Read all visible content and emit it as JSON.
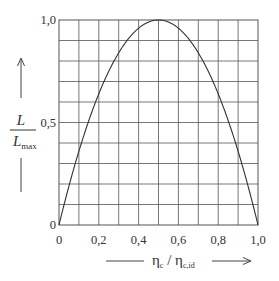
{
  "chart_data": {
    "type": "line",
    "title": "",
    "xlabel": "ηc / ηc,id",
    "xlabel_parts": {
      "main": "η",
      "sub": "c",
      "sep": " / ",
      "main2": "η",
      "sub2": "c,id"
    },
    "ylabel": "L / Lmax",
    "ylabel_parts": {
      "num": "L",
      "den": "L",
      "den_sub": "max"
    },
    "xlim": [
      0,
      1.0
    ],
    "ylim": [
      0,
      1.0
    ],
    "x_ticks": [
      "0",
      "0,2",
      "0,4",
      "0,6",
      "0,8",
      "1,0"
    ],
    "x_tick_values": [
      0,
      0.2,
      0.4,
      0.6,
      0.8,
      1.0
    ],
    "y_ticks": [
      "0",
      "0,5",
      "1,0"
    ],
    "y_tick_values": [
      0,
      0.5,
      1.0
    ],
    "grid": {
      "on": true,
      "x_step": 0.1,
      "y_step": 0.1
    },
    "series": [
      {
        "name": "L/Lmax",
        "x": [
          0,
          0.05,
          0.1,
          0.15,
          0.2,
          0.25,
          0.3,
          0.35,
          0.4,
          0.45,
          0.5,
          0.55,
          0.6,
          0.65,
          0.7,
          0.75,
          0.8,
          0.85,
          0.9,
          0.95,
          1.0
        ],
        "values": [
          0,
          0.19,
          0.36,
          0.51,
          0.64,
          0.75,
          0.84,
          0.91,
          0.96,
          0.99,
          1.0,
          0.99,
          0.96,
          0.91,
          0.84,
          0.75,
          0.64,
          0.51,
          0.36,
          0.19,
          0
        ]
      }
    ],
    "colors": {
      "grid": "#555555",
      "curve": "#333333",
      "text": "#333333"
    }
  }
}
